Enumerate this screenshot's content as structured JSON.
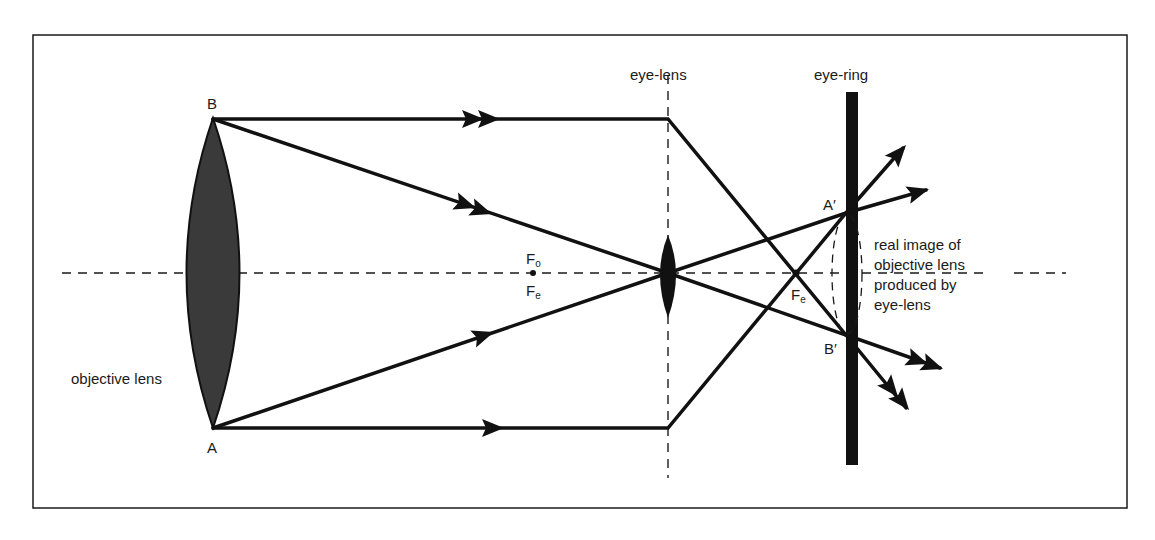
{
  "diagram": {
    "type": "optics ray diagram — astronomical telescope eye-ring",
    "colors": {
      "ink": "#1a1a1a",
      "lens_fill": "#3a3a3a",
      "background": "#ffffff"
    },
    "labels": {
      "point_b": "B",
      "point_a": "A",
      "objective_lens": "objective lens",
      "eye_lens": "eye-lens",
      "eye_ring": "eye-ring",
      "focus_objective": "F",
      "focus_objective_sub": "o",
      "focus_eye": "F",
      "focus_eye_sub": "e",
      "focus_eye_right": "F",
      "focus_eye_right_sub": "e",
      "image_a": "A′",
      "image_b": "B′",
      "annotation_lines": [
        "real image of",
        "objective lens",
        "produced by",
        "eye-lens"
      ]
    }
  }
}
